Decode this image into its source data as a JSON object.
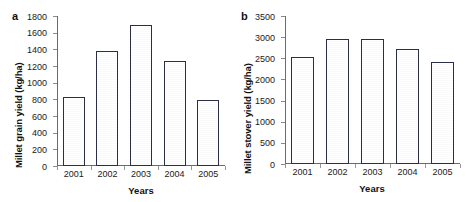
{
  "figure": {
    "panels": [
      {
        "letter": "a",
        "chart_data": {
          "type": "bar",
          "title": "",
          "categories": [
            "2001",
            "2002",
            "2003",
            "2004",
            "2005"
          ],
          "values": [
            830,
            1380,
            1690,
            1260,
            790
          ],
          "xlabel": "Years",
          "ylabel": "Millet grain yield (kg/ha)",
          "ylim": [
            0,
            1800
          ],
          "yticks": [
            0,
            200,
            400,
            600,
            800,
            1000,
            1200,
            1400,
            1600,
            1800
          ],
          "ytick_labels": [
            "0",
            "200",
            "400",
            "600",
            "800",
            "1000",
            "1200",
            "1400",
            "1600",
            "1800"
          ],
          "grid": false,
          "legend": "none",
          "bar_fill_color": "#8b90b8",
          "bar_edge_color": "#2a2f45"
        }
      },
      {
        "letter": "b",
        "chart_data": {
          "type": "bar",
          "title": "",
          "categories": [
            "2001",
            "2002",
            "2003",
            "2004",
            "2005"
          ],
          "values": [
            2520,
            2950,
            2945,
            2730,
            2420
          ],
          "xlabel": "Years",
          "ylabel": "Millet stover yield (kg/ha)",
          "ylim": [
            0,
            3500
          ],
          "yticks": [
            0,
            500,
            1000,
            1500,
            2000,
            2500,
            3000,
            3500
          ],
          "ytick_labels": [
            "0",
            "500",
            "1000",
            "1500",
            "2000",
            "2500",
            "3000",
            "3500"
          ],
          "grid": false,
          "legend": "none",
          "bar_fill_color": "#8b90b8",
          "bar_edge_color": "#2a2f45"
        }
      }
    ]
  }
}
